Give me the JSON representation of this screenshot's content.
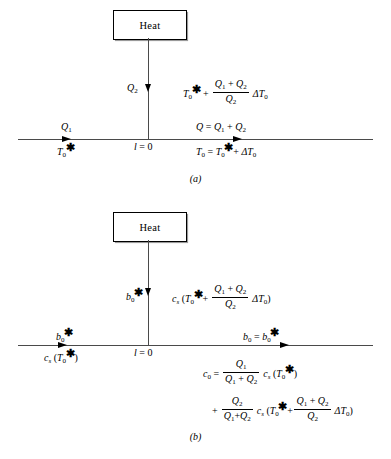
{
  "figure": {
    "type": "schematic-diagram",
    "panels": [
      {
        "id": "a",
        "caption": "(a)",
        "box_label": "Heat",
        "origin_label": "l = 0",
        "vertical_flow_label": "Q2",
        "vertical_temperature_expression": "T0* + ((Q1 + Q2)/Q2) ΔT0",
        "inlet_flow_label": "Q1",
        "inlet_state_label": "T0*",
        "outlet_flow_label": "Q = Q1 + Q2",
        "outlet_state_label": "T0 = T0* + ΔT0"
      },
      {
        "id": "b",
        "caption": "(b)",
        "box_label": "Heat",
        "origin_label": "l = 0",
        "vertical_flow_label": "b0*",
        "vertical_concentration_expression": "cs (T0* + ((Q1 + Q2)/Q2) ΔT0)",
        "inlet_flow_label": "b0*",
        "inlet_state_label": "cs (T0*)",
        "outlet_flow_label": "b0 = b0*",
        "outlet_state_line1": "c0 = (Q1/(Q1 + Q2)) cs (T0*)",
        "outlet_state_line2": "+ (Q2/(Q1 + Q2)) cs (T0* + ((Q1 + Q2)/Q2) ΔT0)"
      }
    ],
    "symbols": {
      "heat_flow_total": "Q",
      "heat_flow_stream_1": "Q1",
      "heat_flow_stream_2": "Q2",
      "temperature_initial": "T0",
      "temperature_starred": "T0*",
      "temperature_increment": "ΔT0",
      "concentration_initial": "c0",
      "concentration_function": "cs",
      "position": "l",
      "flow_rate": "b0"
    },
    "colors": {
      "stroke": "#000000",
      "line": "#4a4a4a",
      "background": "#ffffff"
    }
  }
}
